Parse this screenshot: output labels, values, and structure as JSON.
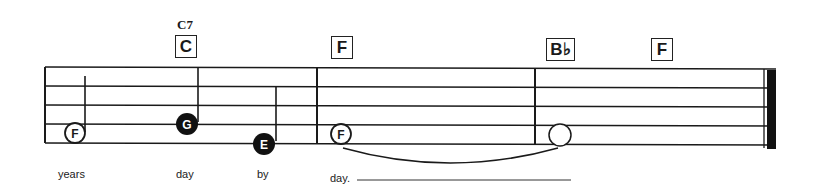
{
  "score": {
    "chords": [
      {
        "symbol": "C",
        "above": "C7",
        "x": 175
      },
      {
        "symbol": "F",
        "above": "",
        "x": 331
      },
      {
        "symbol": "B♭",
        "above": "",
        "x": 546
      },
      {
        "symbol": "F",
        "above": "",
        "x": 651
      }
    ],
    "notes": [
      {
        "letter": "F",
        "filled": false,
        "x": 75,
        "y": 133,
        "stem": "up"
      },
      {
        "letter": "G",
        "filled": true,
        "x": 186,
        "y": 124,
        "stem": "up"
      },
      {
        "letter": "E",
        "filled": true,
        "x": 264,
        "y": 143,
        "stem": "up"
      },
      {
        "letter": "F",
        "filled": false,
        "x": 341,
        "y": 133,
        "stem": "none"
      },
      {
        "letter": "",
        "filled": false,
        "x": 560,
        "y": 133,
        "stem": "none"
      }
    ],
    "lyrics": [
      {
        "text": "years",
        "x": 58
      },
      {
        "text": "day",
        "x": 176
      },
      {
        "text": "by",
        "x": 257
      },
      {
        "text": "day.",
        "x": 330
      }
    ],
    "colors": {
      "ink": "#1a1a1a",
      "paper": "#ffffff"
    }
  }
}
